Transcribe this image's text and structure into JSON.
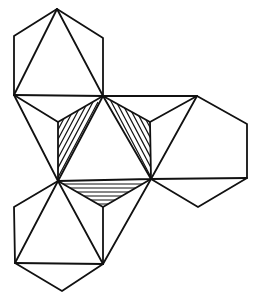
{
  "diagram": {
    "title": "Net of a polyhedron (three hexagonal flaps around a central hexagon with hatched triangles)",
    "type": "geometric-net",
    "colors": {
      "stroke": "#111111",
      "background": "#ffffff"
    },
    "vertices": {
      "top_apex": [
        57,
        9
      ],
      "top_ul": [
        14,
        36
      ],
      "top_ur": [
        103,
        38
      ],
      "top_ll": [
        14,
        95
      ],
      "center_top": [
        103,
        96
      ],
      "inner_ul": [
        58,
        122
      ],
      "inner_ur": [
        150,
        122
      ],
      "center_left": [
        58,
        181
      ],
      "center_right": [
        151,
        179
      ],
      "inner_bottom": [
        103,
        207
      ],
      "right_top": [
        197,
        96
      ],
      "right_ur": [
        247,
        124
      ],
      "right_lr": [
        247,
        178
      ],
      "right_bottom": [
        198,
        207
      ],
      "bottom_ul": [
        14,
        207
      ],
      "bottom_ll": [
        15,
        263
      ],
      "bottom_apex": [
        62,
        291
      ],
      "bottom_lr": [
        103,
        264
      ]
    },
    "faces": [
      {
        "name": "top-hexagon",
        "shading": "none"
      },
      {
        "name": "right-hexagon",
        "shading": "none"
      },
      {
        "name": "bottom-hexagon",
        "shading": "none"
      },
      {
        "name": "central-triangle",
        "shading": "none"
      },
      {
        "name": "left-hatched-triangle",
        "shading": "diagonal-up"
      },
      {
        "name": "right-hatched-triangle",
        "shading": "diagonal-down"
      },
      {
        "name": "bottom-hatched-triangle",
        "shading": "horizontal"
      }
    ]
  }
}
